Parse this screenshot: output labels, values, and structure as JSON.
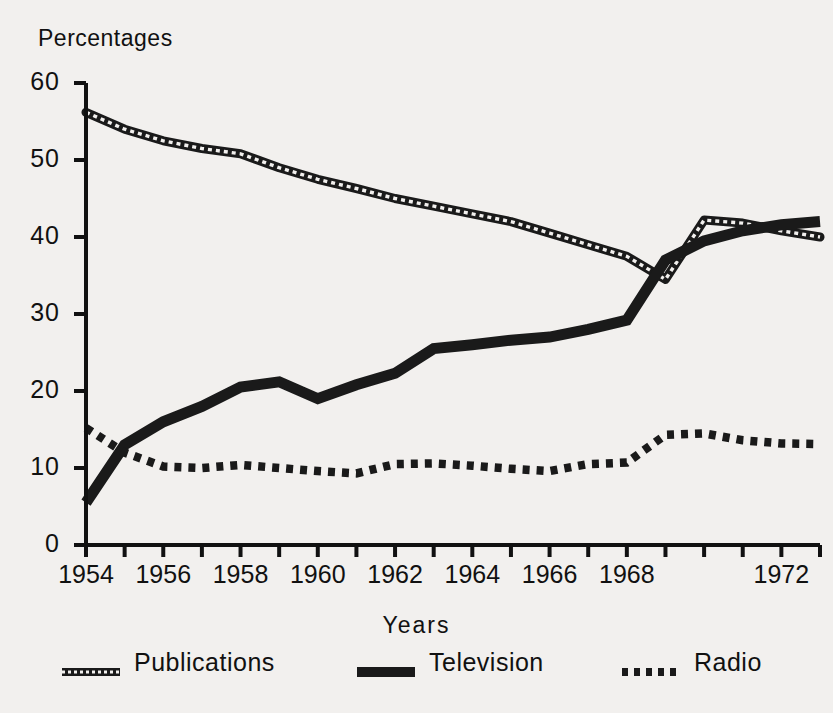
{
  "chart_data": {
    "type": "line",
    "title": "",
    "ylabel": "Percentages",
    "xlabel": "Years",
    "ylim": [
      0,
      60
    ],
    "ytick_labels": [
      "60",
      "50",
      "40",
      "30",
      "20",
      "10",
      "0"
    ],
    "ytick_values": [
      60,
      50,
      40,
      30,
      20,
      10,
      0
    ],
    "xlim": [
      1954,
      1973
    ],
    "xtick_labels": [
      "1954",
      "1956",
      "1958",
      "1960",
      "1962",
      "1964",
      "1966",
      "1968",
      "1972"
    ],
    "xtick_values": [
      1954,
      1956,
      1958,
      1960,
      1962,
      1964,
      1966,
      1968,
      1972
    ],
    "grid": false,
    "legend_position": "bottom",
    "x": [
      1954,
      1955,
      1956,
      1957,
      1958,
      1959,
      1960,
      1961,
      1962,
      1963,
      1964,
      1965,
      1966,
      1967,
      1968,
      1969,
      1970,
      1971,
      1972,
      1973
    ],
    "series": [
      {
        "name": "Publications",
        "style": "chain",
        "color": "#1a1a1a",
        "values": [
          56.2,
          54.0,
          52.5,
          51.5,
          50.8,
          49.0,
          47.5,
          46.3,
          45.0,
          44.0,
          43.0,
          42.0,
          40.5,
          39.0,
          37.5,
          34.5,
          42.2,
          41.8,
          40.8,
          40.0
        ]
      },
      {
        "name": "Television",
        "style": "thick-solid",
        "color": "#1a1a1a",
        "values": [
          5.5,
          13.0,
          16.0,
          18.0,
          20.5,
          21.2,
          19.0,
          20.8,
          22.3,
          25.5,
          26.0,
          26.6,
          27.0,
          28.0,
          29.2,
          37.0,
          39.5,
          40.8,
          41.6,
          42.0
        ]
      },
      {
        "name": "Radio",
        "style": "dotted",
        "color": "#1a1a1a",
        "values": [
          15.2,
          12.0,
          10.2,
          10.0,
          10.4,
          10.0,
          9.6,
          9.3,
          10.5,
          10.6,
          10.3,
          9.9,
          9.6,
          10.5,
          10.7,
          14.3,
          14.5,
          13.6,
          13.2,
          13.1
        ]
      }
    ]
  },
  "legend": {
    "items": [
      {
        "label": "Publications",
        "key": "chain-line-key"
      },
      {
        "label": "Television",
        "key": "solid-line-key"
      },
      {
        "label": "Radio",
        "key": "dotted-line-key"
      }
    ]
  }
}
